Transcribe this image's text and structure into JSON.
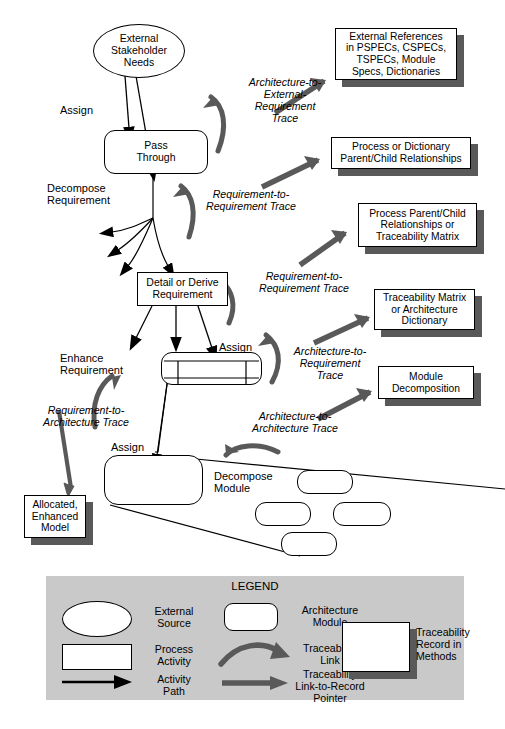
{
  "diagram": {
    "colors": {
      "stroke": "#000000",
      "fill": "#ffffff",
      "trace_arrow": "#595959",
      "shadow": "#595959",
      "legend_bg": "#c9c9c9"
    },
    "nodes": {
      "external_stakeholder_needs": "External\nStakeholder\nNeeds",
      "pass_through": "Pass\nThrough",
      "detail_or_derive_requirement": "Detail or Derive\nRequirement",
      "enhance_module": "",
      "assign_module": "",
      "decompose_child_1": "",
      "decompose_child_2": "",
      "decompose_child_3": "",
      "decompose_child_4": ""
    },
    "activity_labels": {
      "assign_1": "Assign",
      "decompose_requirement": "Decompose\nRequirement",
      "enhance_requirement": "Enhance\nRequirement",
      "assign_2": "Assign",
      "assign_3": "Assign",
      "decompose_module": "Decompose\nModule"
    },
    "trace_labels": {
      "architecture_to_external_requirement": "Architecture-to-\nExternal-\nRequirement\nTrace",
      "requirement_to_requirement_1": "Requirement-to-\nRequirement Trace",
      "requirement_to_requirement_2": "Requirement-to-\nRequirement Trace",
      "architecture_to_requirement": "Architecture-to-\nRequirement\nTrace",
      "architecture_to_architecture": "Architecture-to-\nArchitecture Trace",
      "requirement_to_architecture": "Requirement-to-\nArchitecture Trace"
    },
    "records": [
      {
        "id": "external-references",
        "text": "External References\nin PSPECs, CSPECs,\nTSPECs, Module\nSpecs, Dictionaries"
      },
      {
        "id": "process-or-dictionary",
        "text": "Process or Dictionary\nParent/Child Relationships"
      },
      {
        "id": "process-parent-child",
        "text": "Process Parent/Child\nRelationships or\nTraceability Matrix"
      },
      {
        "id": "traceability-matrix",
        "text": "Traceability Matrix\nor Architecture\nDictionary"
      },
      {
        "id": "module-decomposition",
        "text": "Module\nDecomposition"
      }
    ],
    "output_model": "Allocated,\nEnhanced\nModel"
  },
  "legend": {
    "title": "LEGEND",
    "items": [
      {
        "id": "external-source",
        "label": "External\nSource",
        "symbol": "ellipse"
      },
      {
        "id": "process-activity",
        "label": "Process\nActivity",
        "symbol": "rectangle"
      },
      {
        "id": "activity-path",
        "label": "Activity\nPath",
        "symbol": "thin-arrow"
      },
      {
        "id": "architecture-module",
        "label": "Architecture\nModule",
        "symbol": "rounded-rectangle"
      },
      {
        "id": "traceability-link",
        "label": "Traceability\nLink",
        "symbol": "curved-arrow"
      },
      {
        "id": "traceability-link-to-record-pointer",
        "label": "Traceability\nLink-to-Record\nPointer",
        "symbol": "thick-arrow"
      },
      {
        "id": "traceability-record-in-methods",
        "label": "Traceability\nRecord in\nMethods",
        "symbol": "shadow-box"
      }
    ]
  }
}
